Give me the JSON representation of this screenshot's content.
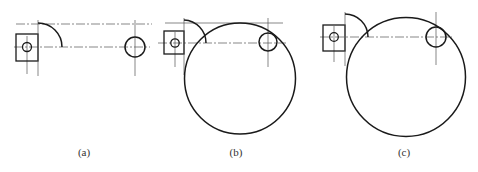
{
  "figure": {
    "panels": [
      {
        "id": "a",
        "label": "(a)",
        "description": "Small crank circle in square block with quarter arc and separate small circle",
        "label_pos": [
          84,
          156
        ]
      },
      {
        "id": "b",
        "label": "(b)",
        "description": "Large circle passing through arc, tangent to small circle from inside",
        "label_pos": [
          236,
          156
        ]
      },
      {
        "id": "c",
        "label": "(c)",
        "description": "Larger circle tangent externally to arc region and internally to small circle",
        "label_pos": [
          404,
          156
        ]
      }
    ],
    "colors": {
      "line": "#1a1a1a",
      "centerline": "#555555",
      "background": "#ffffff"
    }
  }
}
